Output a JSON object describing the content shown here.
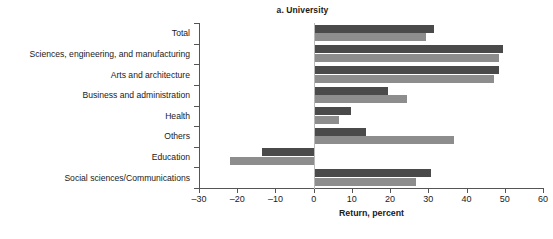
{
  "chart_data": {
    "type": "bar",
    "orientation": "horizontal",
    "title": "a. University",
    "xlabel": "Return, percent",
    "ylabel": "",
    "xlim": [
      -30,
      60
    ],
    "xticks": [
      -30,
      -20,
      -10,
      0,
      10,
      20,
      30,
      40,
      50,
      60
    ],
    "xticklabels": [
      "–30",
      "–20",
      "–10",
      "0",
      "10",
      "20",
      "30",
      "40",
      "50",
      "60"
    ],
    "grid": false,
    "legend": "none",
    "categories": [
      "Total",
      "Sciences, engineering, and manufacturing",
      "Arts and architecture",
      "Business and administration",
      "Health",
      "Others",
      "Education",
      "Social sciences/Communications"
    ],
    "series": [
      {
        "name": "series-dark",
        "color": "#4a4a4a",
        "values": [
          31.5,
          49.5,
          48.5,
          19.5,
          9.7,
          13.7,
          -13.5,
          30.7
        ]
      },
      {
        "name": "series-light",
        "color": "#8d8d8d",
        "values": [
          29.5,
          48.5,
          47.3,
          24.5,
          6.5,
          36.7,
          -22.0,
          26.7
        ]
      }
    ]
  },
  "footnote": "",
  "colors": {
    "axis": "#555555",
    "zero_line": "#b9b9b9",
    "background": "#ffffff",
    "dark_series": "#4a4a4a",
    "light_series": "#8d8d8d"
  }
}
